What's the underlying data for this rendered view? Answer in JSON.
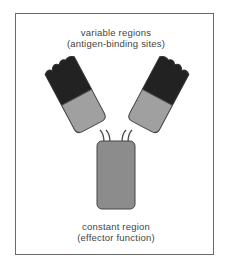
{
  "diagram": {
    "top_label": {
      "line1": "variable regions",
      "line2": "(antigen-binding sites)"
    },
    "bottom_label": {
      "line1": "constant region",
      "line2": "(effector function)"
    },
    "colors": {
      "variable_region": "#222222",
      "constant_arm": "#a0a0a0",
      "stem": "#8a8a8a",
      "outline": "#444444",
      "frame": "#6a6a6a"
    }
  }
}
